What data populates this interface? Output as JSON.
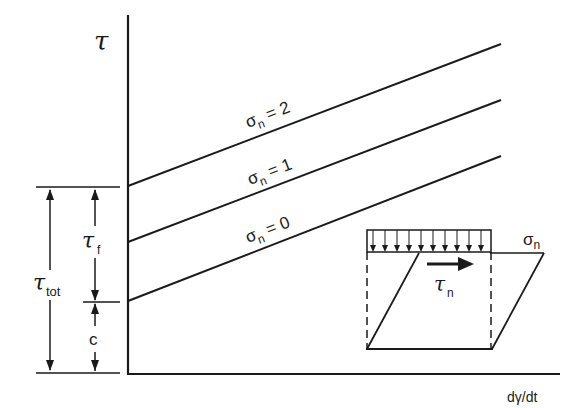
{
  "diagram": {
    "y_axis_label": "τ",
    "x_axis_label": "dγ/dt",
    "lines": [
      {
        "label_sym": "σ",
        "label_sub": "n",
        "label_rest": " = 2"
      },
      {
        "label_sym": "σ",
        "label_sub": "n",
        "label_rest": " = 1"
      },
      {
        "label_sym": "σ",
        "label_sub": "n",
        "label_rest": " = 0"
      }
    ],
    "dimensions": {
      "total": {
        "sym": "τ",
        "sub": "tot"
      },
      "friction": {
        "sym": "τ",
        "sub": "f"
      },
      "cohesion": "c"
    },
    "inset": {
      "normal_stress": {
        "sym": "σ",
        "sub": "n"
      },
      "shear_stress": {
        "sym": "τ",
        "sub": "n"
      }
    }
  }
}
